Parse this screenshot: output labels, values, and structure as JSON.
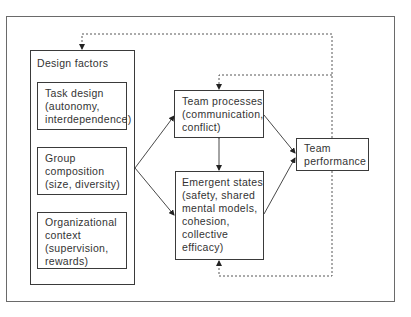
{
  "diagram": {
    "design_factors": {
      "title": "Design factors",
      "items": [
        {
          "label": "Task design\n(autonomy,\ninterdependence)"
        },
        {
          "label": "Group\ncomposition\n(size, diversity)"
        },
        {
          "label": "Organizational\ncontext\n(supervision,\nrewards)"
        }
      ]
    },
    "team_processes": {
      "label": "Team processes\n(communication,\nconflict)"
    },
    "emergent_states": {
      "label": "Emergent states\n(safety, shared\nmental models,\ncohesion,\ncollective\nefficacy)"
    },
    "team_performance": {
      "label": "Team\nperformance"
    },
    "edges": [
      {
        "from": "design_factors",
        "to": "team_processes",
        "style": "solid"
      },
      {
        "from": "design_factors",
        "to": "emergent_states",
        "style": "solid"
      },
      {
        "from": "team_processes",
        "to": "emergent_states",
        "style": "solid-bidirectional"
      },
      {
        "from": "team_processes",
        "to": "team_performance",
        "style": "solid"
      },
      {
        "from": "emergent_states",
        "to": "team_performance",
        "style": "solid"
      },
      {
        "from": "team_performance",
        "to": "design_factors",
        "style": "dashed-feedback"
      },
      {
        "from": "team_performance",
        "to": "team_processes",
        "style": "dashed-feedback"
      },
      {
        "from": "team_performance",
        "to": "emergent_states",
        "style": "dashed-feedback"
      }
    ],
    "colors": {
      "line": "#333333",
      "frame": "#6a6a6a",
      "background": "#ffffff"
    }
  }
}
